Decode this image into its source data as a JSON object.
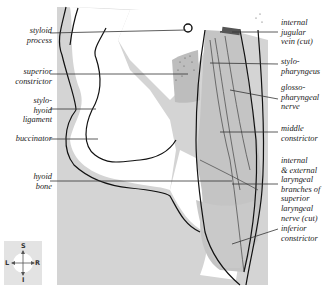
{
  "figure": {
    "labels_left": [
      {
        "id": "styloid-process",
        "text": "styloid\nprocess",
        "x": 4,
        "y": 26,
        "line_y": 33
      },
      {
        "id": "superior-constrictor",
        "text": "superior\nconstrictor",
        "x": 4,
        "y": 67,
        "line_y": 74
      },
      {
        "id": "stylohyoid-ligament",
        "text": "stylo-\nhyoid\nligament",
        "x": 4,
        "y": 96,
        "line_y": 109
      },
      {
        "id": "buccinator",
        "text": "buccinator",
        "x": 4,
        "y": 134,
        "line_y": 139
      },
      {
        "id": "hyoid-bone",
        "text": "hyoid\nbone",
        "x": 4,
        "y": 172,
        "line_y": 181
      }
    ],
    "labels_right": [
      {
        "id": "internal-jugular-vein",
        "text": "internal\njugular\nvein (cut)",
        "y": 18,
        "line_y": 32
      },
      {
        "id": "stylopharyngeus",
        "text": "stylo-\npharyngeus",
        "y": 57,
        "line_y": 64
      },
      {
        "id": "glossopharyngeal-nerve",
        "text": "glosso-\npharyngeal\nnerve",
        "y": 83,
        "line_y": 99
      },
      {
        "id": "middle-constrictor",
        "text": "middle\nconstrictor",
        "y": 124,
        "line_y": 132
      },
      {
        "id": "laryngeal-branches",
        "text": "internal\n& external\nlaryngeal\nbranches of\nsuperior\nlaryngeal\nnerve (cut)",
        "y": 156,
        "line_y": 184
      },
      {
        "id": "inferior-constrictor",
        "text": "inferior\nconstrictor",
        "y": 224,
        "line_y": 229
      }
    ],
    "orientation_compass": {
      "superior": "S",
      "inferior": "I",
      "left": "L",
      "right": "R"
    },
    "colors": {
      "background_panel": "#d4d4d4",
      "muscle_fill": "#c4c4c4",
      "outline": "#111111",
      "leader_line": "#333333"
    }
  }
}
